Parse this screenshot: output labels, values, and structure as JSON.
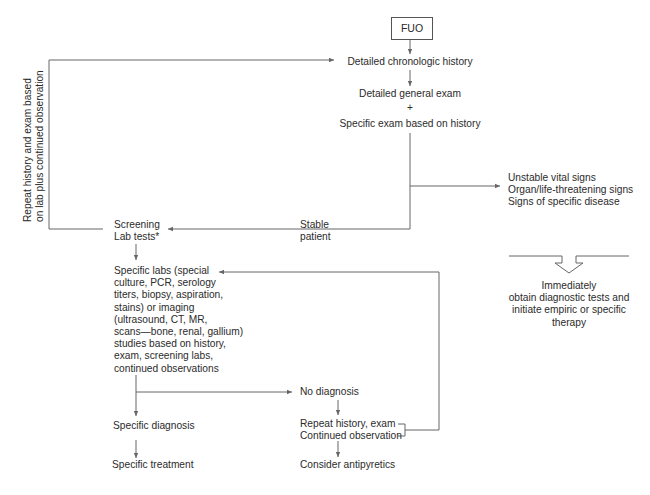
{
  "diagram": {
    "title": "FUO",
    "nodes": {
      "start": "FUO",
      "history": "Detailed chronologic history",
      "exam_line1": "Detailed general exam",
      "exam_plus": "+",
      "exam_line2": "Specific exam based on history",
      "unstable": [
        "Unstable vital signs",
        "Organ/life-threatening signs",
        "Signs of specific disease"
      ],
      "stable": [
        "Stable",
        "patient"
      ],
      "screening": [
        "Screening",
        "Lab tests*"
      ],
      "immediate": [
        "Immediately",
        "obtain diagnostic tests and",
        "initiate empiric or specific",
        "therapy"
      ],
      "specific_labs": [
        "Specific labs (special",
        "culture, PCR, serology",
        "titers, biopsy, aspiration,",
        "stains) or imaging",
        "(ultrasound, CT, MR,",
        "scans—bone, renal, gallium)",
        "studies based on history,",
        "exam, screening labs,",
        "continued observations"
      ],
      "no_diagnosis": "No diagnosis",
      "repeat": [
        "Repeat history, exam",
        "Continued observation"
      ],
      "specific_diagnosis": "Specific diagnosis",
      "specific_treatment": "Specific treatment",
      "antipyretics": "Consider antipyretics",
      "loop_label": [
        "Repeat history and exam based",
        "on lab plus continued observation"
      ]
    },
    "colors": {
      "line": "#666666",
      "text": "#2b2b2b",
      "background": "#ffffff"
    }
  }
}
